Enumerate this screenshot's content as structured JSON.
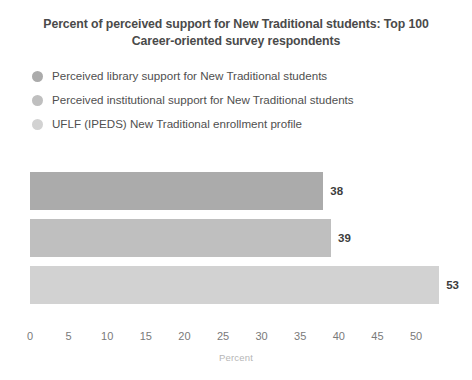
{
  "chart_data": {
    "type": "bar",
    "orientation": "horizontal",
    "title": "Percent of perceived support for New Traditional students: Top 100 Career-oriented survey respondents",
    "title_lines": [
      "Percent of perceived support for New Traditional students: Top 100",
      "Career-oriented survey respondents"
    ],
    "categories": [
      "Perceived library support for New Traditional students",
      "Perceived institutional support for New Traditional students",
      "UFLF (IPEDS) New Traditional enrollment profile"
    ],
    "values": [
      38,
      39,
      53
    ],
    "value_labels": [
      "38",
      "39",
      "53"
    ],
    "colors": [
      "#ababab",
      "#bfbfbf",
      "#d2d2d2"
    ],
    "xlabel": "Percent",
    "ylabel": "",
    "xlim": [
      0,
      53
    ],
    "xticks": [
      0,
      5,
      10,
      15,
      20,
      25,
      30,
      35,
      40,
      45,
      50
    ],
    "xtick_labels": [
      "0",
      "5",
      "10",
      "15",
      "20",
      "25",
      "30",
      "35",
      "40",
      "45",
      "50"
    ],
    "grid": false,
    "legend_position": "top",
    "legend": [
      {
        "label": "Perceived library support for New Traditional students",
        "color": "#ababab"
      },
      {
        "label": "Perceived institutional support for New Traditional students",
        "color": "#bfbfbf"
      },
      {
        "label": "UFLF (IPEDS) New Traditional enrollment profile",
        "color": "#d2d2d2"
      }
    ],
    "background": "#ffffff",
    "text_color": "#4a4a4a"
  }
}
